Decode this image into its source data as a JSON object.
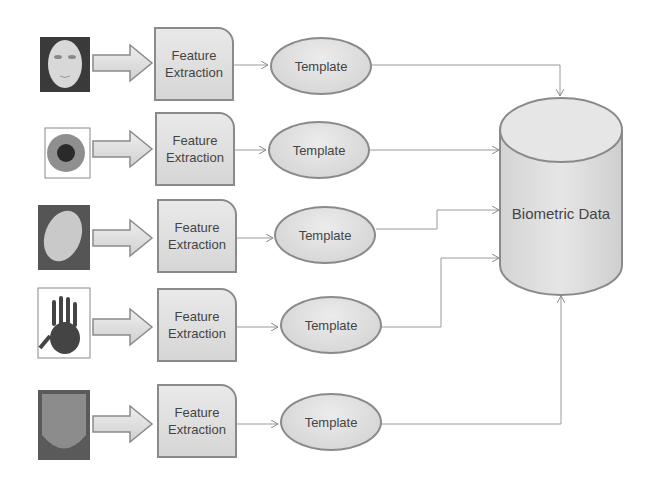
{
  "diagram": {
    "rows": [
      {
        "input": "face-image",
        "process": {
          "line1": "Feature",
          "line2": "Extraction"
        },
        "output": "Template"
      },
      {
        "input": "iris-image",
        "process": {
          "line1": "Feature",
          "line2": "Extraction"
        },
        "output": "Template"
      },
      {
        "input": "fingerprint-image",
        "process": {
          "line1": "Feature",
          "line2": "Extraction"
        },
        "output": "Template"
      },
      {
        "input": "palmprint-image",
        "process": {
          "line1": "Feature",
          "line2": "Extraction"
        },
        "output": "Template"
      },
      {
        "input": "tongue-image",
        "process": {
          "line1": "Feature",
          "line2": "Extraction"
        },
        "output": "Template"
      }
    ],
    "database": {
      "label": "Biometric Data"
    },
    "colors": {
      "stroke": "#8a8a8a",
      "fill": "#dcdcdc",
      "text": "#444444"
    }
  }
}
